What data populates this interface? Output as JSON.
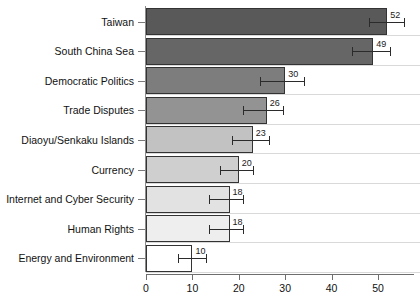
{
  "chart_data": {
    "type": "bar",
    "orientation": "horizontal",
    "title": "",
    "subtitle": "",
    "xlabel": "",
    "ylabel": "",
    "xlim": [
      0,
      57.7
    ],
    "xticks": [
      0,
      10,
      20,
      30,
      40,
      50
    ],
    "xtick_labels": [
      "0",
      "10",
      "20",
      "30",
      "40",
      "50"
    ],
    "grid": false,
    "legend": null,
    "categories": [
      "Taiwan",
      "South China Sea",
      "Democratic Politics",
      "Trade Disputes",
      "Diaoyu/Senkaku Islands",
      "Currency",
      "Internet and Cyber Security",
      "Human Rights",
      "Energy and Environment"
    ],
    "values": [
      52,
      49,
      30,
      26,
      23,
      20,
      18,
      18,
      10
    ],
    "data_labels": [
      "52",
      "49",
      "30",
      "26",
      "23",
      "20",
      "18",
      "18",
      "10"
    ],
    "error_low": [
      48.0,
      44.5,
      24.5,
      21.0,
      18.5,
      16.0,
      13.5,
      13.5,
      7.0
    ],
    "error_high": [
      55.5,
      52.5,
      34.0,
      29.5,
      26.5,
      23.0,
      21.0,
      21.0,
      13.0
    ],
    "bar_colors": [
      "#595959",
      "#666666",
      "#7d7d7d",
      "#939393",
      "#c2c2c2",
      "#cfcfcf",
      "#e2e2e2",
      "#eeeeee",
      "#ffffff"
    ],
    "bar_edge_color": "#333333",
    "error_bar_color": "#2b2b2b",
    "axis_color": "#6e6e6e"
  }
}
